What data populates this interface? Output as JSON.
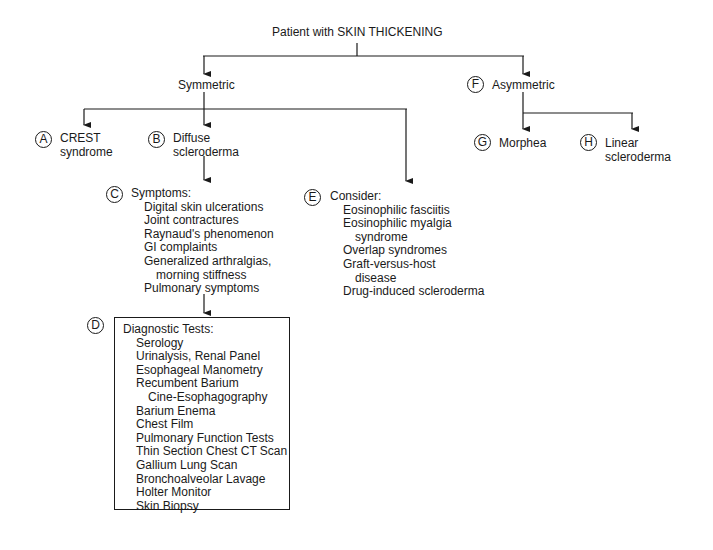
{
  "root": {
    "label": "Patient with SKIN THICKENING"
  },
  "symmetric": {
    "label": "Symmetric"
  },
  "asymmetric": {
    "badge": "F",
    "label": "Asymmetric"
  },
  "crest": {
    "badge": "A",
    "line1": "CREST",
    "line2": "syndrome"
  },
  "diffuse": {
    "badge": "B",
    "line1": "Diffuse",
    "line2": "scleroderma"
  },
  "symptoms": {
    "badge": "C",
    "title": "Symptoms:",
    "items": [
      {
        "text": "Digital skin ulcerations",
        "indent": 1
      },
      {
        "text": "Joint contractures",
        "indent": 1
      },
      {
        "text": "Raynaud's phenomenon",
        "indent": 1
      },
      {
        "text": "GI complaints",
        "indent": 1
      },
      {
        "text": "Generalized arthralgias,",
        "indent": 1
      },
      {
        "text": "morning stiffness",
        "indent": 2
      },
      {
        "text": "Pulmonary symptoms",
        "indent": 1
      }
    ]
  },
  "consider": {
    "badge": "E",
    "title": "Consider:",
    "items": [
      {
        "text": "Eosinophilic fasciitis",
        "indent": 1
      },
      {
        "text": "Eosinophilic myalgia",
        "indent": 1
      },
      {
        "text": "syndrome",
        "indent": 2
      },
      {
        "text": "Overlap syndromes",
        "indent": 1
      },
      {
        "text": "Graft-versus-host",
        "indent": 1
      },
      {
        "text": "disease",
        "indent": 2
      },
      {
        "text": "Drug-induced scleroderma",
        "indent": 1
      }
    ]
  },
  "diagnostic": {
    "badge": "D",
    "title": "Diagnostic Tests:",
    "items": [
      {
        "text": "Serology",
        "indent": 1
      },
      {
        "text": "Urinalysis, Renal Panel",
        "indent": 1
      },
      {
        "text": "Esophageal Manometry",
        "indent": 1
      },
      {
        "text": "Recumbent Barium",
        "indent": 1
      },
      {
        "text": "Cine-Esophagography",
        "indent": 2
      },
      {
        "text": "Barium Enema",
        "indent": 1
      },
      {
        "text": "Chest Film",
        "indent": 1
      },
      {
        "text": "Pulmonary Function Tests",
        "indent": 1
      },
      {
        "text": "Thin Section Chest CT Scan",
        "indent": 1
      },
      {
        "text": "Gallium Lung Scan",
        "indent": 1
      },
      {
        "text": "Bronchoalveolar Lavage",
        "indent": 1
      },
      {
        "text": "Holter Monitor",
        "indent": 1
      },
      {
        "text": "Skin Biopsy",
        "indent": 1
      }
    ]
  },
  "morphea": {
    "badge": "G",
    "label": "Morphea"
  },
  "linear": {
    "badge": "H",
    "line1": "Linear",
    "line2": "scleroderma"
  }
}
